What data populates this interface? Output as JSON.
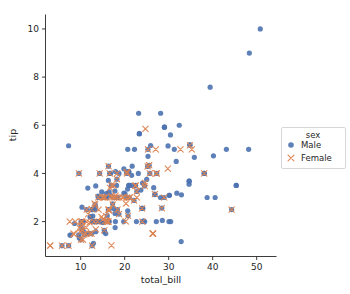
{
  "chart_data": {
    "type": "scatter",
    "title": "",
    "xlabel": "total_bill",
    "ylabel": "tip",
    "xlim": [
      2.0,
      54.5
    ],
    "ylim": [
      0.55,
      10.6
    ],
    "xticks": [
      10,
      20,
      30,
      40,
      50
    ],
    "yticks": [
      2,
      4,
      6,
      8,
      10
    ],
    "grid": false,
    "legend": {
      "title": "sex",
      "position": "right-outside",
      "entries": [
        {
          "label": "Male",
          "color": "#4C72B0",
          "marker": "circle"
        },
        {
          "label": "Female",
          "color": "#DD8452",
          "marker": "x"
        }
      ]
    },
    "series": [
      {
        "name": "Male",
        "color": "#4C72B0",
        "marker": "circle",
        "points": [
          [
            10.34,
            1.66
          ],
          [
            21.01,
            3.5
          ],
          [
            23.68,
            3.31
          ],
          [
            25.29,
            4.71
          ],
          [
            26.88,
            3.12
          ],
          [
            15.04,
            1.96
          ],
          [
            14.78,
            3.23
          ],
          [
            10.27,
            1.71
          ],
          [
            15.42,
            1.57
          ],
          [
            18.43,
            3.0
          ],
          [
            14.83,
            3.02
          ],
          [
            21.58,
            3.92
          ],
          [
            16.29,
            3.71
          ],
          [
            16.97,
            3.5
          ],
          [
            20.65,
            3.35
          ],
          [
            17.92,
            4.08
          ],
          [
            39.42,
            7.58
          ],
          [
            19.82,
            3.18
          ],
          [
            17.81,
            2.34
          ],
          [
            13.37,
            2.0
          ],
          [
            12.69,
            2.0
          ],
          [
            21.7,
            4.3
          ],
          [
            9.55,
            1.45
          ],
          [
            18.35,
            2.5
          ],
          [
            15.06,
            3.0
          ],
          [
            20.69,
            2.45
          ],
          [
            17.78,
            3.27
          ],
          [
            24.06,
            3.6
          ],
          [
            16.31,
            2.0
          ],
          [
            16.93,
            3.07
          ],
          [
            18.69,
            2.31
          ],
          [
            31.27,
            5.0
          ],
          [
            16.04,
            2.24
          ],
          [
            17.46,
            2.54
          ],
          [
            13.94,
            3.06
          ],
          [
            9.68,
            1.32
          ],
          [
            30.4,
            5.6
          ],
          [
            18.29,
            3.0
          ],
          [
            22.23,
            5.0
          ],
          [
            32.4,
            6.0
          ],
          [
            28.55,
            2.05
          ],
          [
            18.04,
            3.0
          ],
          [
            12.54,
            2.5
          ],
          [
            10.29,
            2.6
          ],
          [
            34.81,
            5.2
          ],
          [
            25.71,
            4.0
          ],
          [
            10.07,
            1.83
          ],
          [
            34.65,
            3.68
          ],
          [
            23.33,
            5.65
          ],
          [
            45.35,
            3.5
          ],
          [
            23.17,
            6.5
          ],
          [
            40.55,
            3.0
          ],
          [
            20.69,
            5.0
          ],
          [
            20.9,
            3.5
          ],
          [
            30.46,
            2.0
          ],
          [
            18.15,
            3.5
          ],
          [
            23.1,
            4.0
          ],
          [
            15.69,
            1.5
          ],
          [
            19.81,
            4.19
          ],
          [
            28.44,
            2.56
          ],
          [
            15.48,
            2.02
          ],
          [
            16.58,
            4.0
          ],
          [
            7.56,
            1.44
          ],
          [
            10.34,
            2.0
          ],
          [
            43.11,
            5.0
          ],
          [
            13.0,
            2.0
          ],
          [
            13.51,
            2.0
          ],
          [
            18.71,
            4.0
          ],
          [
            12.74,
            2.01
          ],
          [
            13.0,
            2.0
          ],
          [
            16.4,
            2.5
          ],
          [
            20.53,
            4.0
          ],
          [
            16.47,
            3.23
          ],
          [
            26.59,
            3.41
          ],
          [
            38.73,
            3.0
          ],
          [
            24.27,
            2.03
          ],
          [
            12.76,
            2.23
          ],
          [
            30.06,
            2.0
          ],
          [
            25.89,
            5.16
          ],
          [
            48.33,
            9.0
          ],
          [
            13.27,
            2.5
          ],
          [
            28.17,
            6.5
          ],
          [
            12.9,
            1.1
          ],
          [
            28.15,
            3.0
          ],
          [
            11.59,
            1.5
          ],
          [
            7.74,
            1.44
          ],
          [
            30.14,
            3.09
          ],
          [
            12.16,
            2.2
          ],
          [
            13.42,
            3.48
          ],
          [
            8.58,
            1.92
          ],
          [
            15.98,
            3.0
          ],
          [
            13.42,
            1.58
          ],
          [
            16.27,
            2.5
          ],
          [
            10.09,
            2.0
          ],
          [
            20.45,
            3.0
          ],
          [
            13.28,
            2.72
          ],
          [
            22.12,
            2.88
          ],
          [
            24.01,
            2.0
          ],
          [
            15.69,
            3.0
          ],
          [
            11.61,
            3.39
          ],
          [
            10.77,
            1.47
          ],
          [
            15.53,
            3.0
          ],
          [
            10.07,
            1.25
          ],
          [
            12.6,
            1.0
          ],
          [
            32.83,
            1.17
          ],
          [
            35.83,
            4.67
          ],
          [
            29.03,
            5.92
          ],
          [
            27.18,
            2.0
          ],
          [
            22.67,
            2.0
          ],
          [
            17.82,
            1.75
          ],
          [
            38.07,
            4.0
          ],
          [
            23.95,
            2.55
          ],
          [
            25.56,
            4.34
          ],
          [
            20.08,
            3.15
          ],
          [
            26.86,
            3.14
          ],
          [
            25.28,
            5.0
          ],
          [
            17.26,
            2.74
          ],
          [
            24.55,
            2.0
          ],
          [
            19.77,
            2.0
          ],
          [
            29.85,
            5.14
          ],
          [
            48.17,
            5.0
          ],
          [
            25.0,
            3.75
          ],
          [
            13.39,
            2.61
          ],
          [
            16.49,
            2.0
          ],
          [
            21.5,
            3.5
          ],
          [
            12.66,
            2.5
          ],
          [
            16.21,
            2.0
          ],
          [
            13.81,
            2.0
          ],
          [
            17.51,
            3.0
          ],
          [
            24.52,
            3.48
          ],
          [
            20.76,
            2.24
          ],
          [
            31.71,
            4.5
          ],
          [
            10.59,
            1.61
          ],
          [
            10.63,
            2.0
          ],
          [
            50.81,
            10.0
          ],
          [
            15.81,
            3.16
          ],
          [
            7.25,
            5.15
          ],
          [
            31.85,
            3.18
          ],
          [
            16.82,
            4.0
          ],
          [
            32.9,
            3.11
          ],
          [
            17.89,
            2.0
          ],
          [
            14.48,
            2.0
          ],
          [
            9.6,
            4.0
          ],
          [
            34.63,
            3.55
          ],
          [
            34.65,
            3.68
          ],
          [
            23.33,
            5.65
          ],
          [
            45.35,
            3.5
          ],
          [
            34.83,
            5.17
          ],
          [
            20.49,
            4.06
          ],
          [
            24.13,
            2.55
          ],
          [
            30.14,
            3.09
          ],
          [
            12.16,
            2.2
          ],
          [
            10.33,
            2.0
          ],
          [
            14.15,
            2.0
          ],
          [
            20.92,
            4.08
          ],
          [
            28.97,
            3.0
          ],
          [
            22.49,
            3.5
          ],
          [
            5.75,
            1.0
          ],
          [
            16.32,
            4.3
          ],
          [
            22.75,
            3.25
          ],
          [
            40.17,
            4.73
          ],
          [
            27.28,
            4.0
          ],
          [
            12.03,
            1.5
          ],
          [
            21.01,
            3.0
          ],
          [
            12.46,
            1.5
          ],
          [
            11.35,
            2.5
          ],
          [
            15.38,
            3.0
          ],
          [
            44.3,
            2.5
          ],
          [
            22.42,
            3.48
          ],
          [
            20.92,
            4.08
          ],
          [
            15.36,
            1.64
          ],
          [
            20.49,
            4.06
          ],
          [
            25.21,
            4.29
          ],
          [
            18.24,
            3.76
          ],
          [
            14.31,
            4.0
          ],
          [
            14.0,
            3.0
          ],
          [
            7.25,
            1.0
          ],
          [
            38.07,
            4.0
          ],
          [
            23.95,
            2.55
          ],
          [
            29.03,
            5.92
          ]
        ]
      },
      {
        "name": "Female",
        "color": "#DD8452",
        "marker": "x",
        "points": [
          [
            16.99,
            1.01
          ],
          [
            24.59,
            3.61
          ],
          [
            35.26,
            5.0
          ],
          [
            14.83,
            3.02
          ],
          [
            10.33,
            1.67
          ],
          [
            16.97,
            3.5
          ],
          [
            20.29,
            2.75
          ],
          [
            15.77,
            2.23
          ],
          [
            19.65,
            3.0
          ],
          [
            11.24,
            1.76
          ],
          [
            16.45,
            2.47
          ],
          [
            3.07,
            1.0
          ],
          [
            20.23,
            2.01
          ],
          [
            15.01,
            2.09
          ],
          [
            12.02,
            1.97
          ],
          [
            17.07,
            3.0
          ],
          [
            26.86,
            3.14
          ],
          [
            25.28,
            5.0
          ],
          [
            14.73,
            2.2
          ],
          [
            10.51,
            1.25
          ],
          [
            17.92,
            3.08
          ],
          [
            27.2,
            4.0
          ],
          [
            22.76,
            3.0
          ],
          [
            17.29,
            2.71
          ],
          [
            19.44,
            3.0
          ],
          [
            16.66,
            3.4
          ],
          [
            10.07,
            1.83
          ],
          [
            32.68,
            5.0
          ],
          [
            15.98,
            2.03
          ],
          [
            34.83,
            5.17
          ],
          [
            13.03,
            2.0
          ],
          [
            18.28,
            4.0
          ],
          [
            24.71,
            5.85
          ],
          [
            21.16,
            3.0
          ],
          [
            28.97,
            3.0
          ],
          [
            22.49,
            3.5
          ],
          [
            5.75,
            1.0
          ],
          [
            16.32,
            4.3
          ],
          [
            22.75,
            3.25
          ],
          [
            17.91,
            3.0
          ],
          [
            26.41,
            1.5
          ],
          [
            15.95,
            2.0
          ],
          [
            14.0,
            3.0
          ],
          [
            16.4,
            2.5
          ],
          [
            20.53,
            4.0
          ],
          [
            15.36,
            1.64
          ],
          [
            20.49,
            4.06
          ],
          [
            25.21,
            4.29
          ],
          [
            18.24,
            3.76
          ],
          [
            14.31,
            4.0
          ],
          [
            16.45,
            2.47
          ],
          [
            9.94,
            1.56
          ],
          [
            25.56,
            4.34
          ],
          [
            12.48,
            2.52
          ],
          [
            29.8,
            4.2
          ],
          [
            26.41,
            1.5
          ],
          [
            11.17,
            1.5
          ],
          [
            8.52,
            1.48
          ],
          [
            8.35,
            1.5
          ],
          [
            9.78,
            1.73
          ],
          [
            3.07,
            1.0
          ],
          [
            18.78,
            3.0
          ],
          [
            27.05,
            5.0
          ],
          [
            7.51,
            2.0
          ],
          [
            13.42,
            1.68
          ],
          [
            16.27,
            2.5
          ],
          [
            10.09,
            2.0
          ],
          [
            20.45,
            3.0
          ],
          [
            13.28,
            2.72
          ],
          [
            26.41,
            1.5
          ],
          [
            11.38,
            2.0
          ],
          [
            11.69,
            2.31
          ],
          [
            10.77,
            1.47
          ],
          [
            15.53,
            3.0
          ],
          [
            10.07,
            1.25
          ],
          [
            12.6,
            1.0
          ],
          [
            13.16,
            2.75
          ],
          [
            17.47,
            3.5
          ],
          [
            14.07,
            2.5
          ],
          [
            16.21,
            2.0
          ],
          [
            13.81,
            2.0
          ],
          [
            17.51,
            3.0
          ],
          [
            24.52,
            3.48
          ],
          [
            20.76,
            2.24
          ],
          [
            22.12,
            2.88
          ],
          [
            24.01,
            2.0
          ],
          [
            8.77,
            2.0
          ],
          [
            26.41,
            1.5
          ],
          [
            18.35,
            2.5
          ],
          [
            15.06,
            3.0
          ],
          [
            16.31,
            2.0
          ],
          [
            16.93,
            3.07
          ],
          [
            18.69,
            2.31
          ],
          [
            9.6,
            4.0
          ],
          [
            27.28,
            4.0
          ],
          [
            12.03,
            1.5
          ],
          [
            21.01,
            3.0
          ],
          [
            12.46,
            1.5
          ],
          [
            11.35,
            2.5
          ],
          [
            15.38,
            3.0
          ],
          [
            44.3,
            2.5
          ],
          [
            22.42,
            3.48
          ],
          [
            28.44,
            2.56
          ],
          [
            15.48,
            2.02
          ],
          [
            16.58,
            4.0
          ],
          [
            10.34,
            2.0
          ],
          [
            7.25,
            1.0
          ],
          [
            38.07,
            4.0
          ],
          [
            23.95,
            2.55
          ],
          [
            25.71,
            4.0
          ]
        ]
      }
    ]
  }
}
